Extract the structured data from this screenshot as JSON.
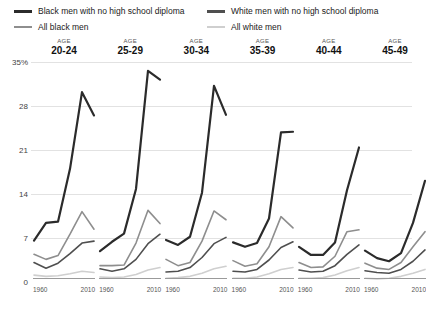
{
  "legend": {
    "items": [
      {
        "label": "Black men with no high school diploma",
        "color": "#2b2b2b",
        "weight": "thick",
        "col": "left"
      },
      {
        "label": "All black men",
        "color": "#8e8e8e",
        "weight": "normal",
        "col": "left"
      },
      {
        "label": "White men with no high school diploma",
        "color": "#4f4f4f",
        "weight": "thick",
        "col": "right"
      },
      {
        "label": "All white men",
        "color": "#cfcfcf",
        "weight": "normal",
        "col": "right"
      }
    ]
  },
  "axes": {
    "age_word": "AGE",
    "y_ticks": [
      "35%",
      "28",
      "21",
      "14",
      "7",
      "0"
    ],
    "y_values": [
      35,
      28,
      21,
      14,
      7,
      0
    ],
    "x_start_label": "1960",
    "x_end_label": "2010"
  },
  "chart_data": {
    "type": "line",
    "title": "",
    "subtitle": "",
    "xlabel": "",
    "ylabel": "",
    "ylim": [
      0,
      35
    ],
    "xlim": [
      1960,
      2010
    ],
    "grid": true,
    "legend_position": "top",
    "x": [
      1960,
      1970,
      1980,
      1990,
      2000,
      2010
    ],
    "panels": [
      {
        "age_word": "AGE",
        "age_range": "20-24",
        "series": [
          {
            "name": "Black men with no high school diploma",
            "color": "#2b2b2b",
            "width": 2.2,
            "values": [
              6.6,
              9.4,
              9.6,
              18.0,
              30.2,
              26.5
            ]
          },
          {
            "name": "All black men",
            "color": "#8e8e8e",
            "width": 1.6,
            "values": [
              4.4,
              3.6,
              4.2,
              7.6,
              11.2,
              8.4
            ]
          },
          {
            "name": "White men with no high school diploma",
            "color": "#4f4f4f",
            "width": 1.6,
            "values": [
              3.1,
              2.2,
              3.0,
              4.5,
              6.2,
              6.5
            ]
          },
          {
            "name": "All white men",
            "color": "#cfcfcf",
            "width": 1.6,
            "values": [
              1.1,
              0.9,
              1.0,
              1.3,
              1.7,
              1.5
            ]
          }
        ]
      },
      {
        "age_word": "AGE",
        "age_range": "25-29",
        "series": [
          {
            "name": "Black men with no high school diploma",
            "color": "#2b2b2b",
            "width": 2.2,
            "values": [
              4.9,
              6.4,
              7.7,
              14.8,
              33.6,
              32.2
            ]
          },
          {
            "name": "All black men",
            "color": "#8e8e8e",
            "width": 1.6,
            "values": [
              2.6,
              2.6,
              2.7,
              6.2,
              11.4,
              9.3
            ]
          },
          {
            "name": "White men with no high school diploma",
            "color": "#4f4f4f",
            "width": 1.6,
            "values": [
              2.1,
              1.7,
              2.1,
              3.6,
              6.1,
              7.6
            ]
          },
          {
            "name": "All white men",
            "color": "#cfcfcf",
            "width": 1.6,
            "values": [
              0.8,
              0.7,
              0.8,
              1.2,
              1.9,
              2.3
            ]
          }
        ]
      },
      {
        "age_word": "AGE",
        "age_range": "30-34",
        "series": [
          {
            "name": "Black men with no high school diploma",
            "color": "#2b2b2b",
            "width": 2.2,
            "values": [
              6.7,
              5.9,
              7.2,
              14.2,
              31.2,
              26.6
            ]
          },
          {
            "name": "All black men",
            "color": "#8e8e8e",
            "width": 1.6,
            "values": [
              3.6,
              2.6,
              3.1,
              6.5,
              11.3,
              9.9
            ]
          },
          {
            "name": "White men with no high school diploma",
            "color": "#4f4f4f",
            "width": 1.6,
            "values": [
              1.6,
              1.7,
              2.3,
              3.9,
              6.1,
              7.1
            ]
          },
          {
            "name": "All white men",
            "color": "#cfcfcf",
            "width": 1.6,
            "values": [
              0.6,
              0.7,
              0.9,
              1.4,
              2.1,
              2.5
            ]
          }
        ]
      },
      {
        "age_word": "AGE",
        "age_range": "35-39",
        "series": [
          {
            "name": "Black men with no high school diploma",
            "color": "#2b2b2b",
            "width": 2.2,
            "values": [
              6.3,
              5.6,
              6.2,
              10.1,
              23.8,
              23.9
            ]
          },
          {
            "name": "All black men",
            "color": "#8e8e8e",
            "width": 1.6,
            "values": [
              3.4,
              2.5,
              2.9,
              5.6,
              10.4,
              8.6
            ]
          },
          {
            "name": "White men with no high school diploma",
            "color": "#4f4f4f",
            "width": 1.6,
            "values": [
              1.7,
              1.6,
              2.0,
              3.5,
              5.5,
              6.4
            ]
          },
          {
            "name": "All white men",
            "color": "#cfcfcf",
            "width": 1.6,
            "values": [
              0.6,
              0.6,
              0.8,
              1.3,
              2.0,
              2.3
            ]
          }
        ]
      },
      {
        "age_word": "AGE",
        "age_range": "40-44",
        "series": [
          {
            "name": "Black men with no high school diploma",
            "color": "#2b2b2b",
            "width": 2.2,
            "values": [
              5.6,
              4.3,
              4.3,
              6.3,
              14.6,
              21.4
            ]
          },
          {
            "name": "All black men",
            "color": "#8e8e8e",
            "width": 1.6,
            "values": [
              3.1,
              2.3,
              2.4,
              4.1,
              8.0,
              8.3
            ]
          },
          {
            "name": "White men with no high school diploma",
            "color": "#4f4f4f",
            "width": 1.6,
            "values": [
              1.9,
              1.6,
              1.7,
              2.6,
              4.4,
              5.9
            ]
          },
          {
            "name": "All white men",
            "color": "#cfcfcf",
            "width": 1.6,
            "values": [
              0.6,
              0.6,
              0.7,
              1.1,
              1.8,
              2.3
            ]
          }
        ]
      },
      {
        "age_word": "AGE",
        "age_range": "45-49",
        "series": [
          {
            "name": "Black men with no high school diploma",
            "color": "#2b2b2b",
            "width": 2.2,
            "values": [
              5.0,
              3.8,
              3.3,
              4.6,
              9.4,
              16.1
            ]
          },
          {
            "name": "All black men",
            "color": "#8e8e8e",
            "width": 1.6,
            "values": [
              3.0,
              2.2,
              2.0,
              3.1,
              5.6,
              8.0
            ]
          },
          {
            "name": "White men with no high school diploma",
            "color": "#4f4f4f",
            "width": 1.6,
            "values": [
              1.8,
              1.5,
              1.4,
              2.0,
              3.3,
              5.1
            ]
          },
          {
            "name": "All white men",
            "color": "#cfcfcf",
            "width": 1.6,
            "values": [
              0.6,
              0.5,
              0.6,
              0.9,
              1.4,
              2.0
            ]
          }
        ]
      }
    ]
  }
}
